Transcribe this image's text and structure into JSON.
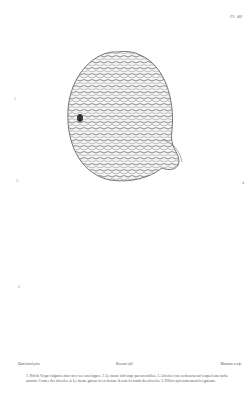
{
  "plate": {
    "number": "Pl. 40",
    "figure_labels": [
      "1",
      "2",
      "3",
      "4"
    ],
    "credits": {
      "left": "Blanchard pinx.",
      "center": "Bocourt del.",
      "right": "Manteau sculp."
    },
    "caption": "1. Nid de Vespa vulgaris entier avec ses enveloppes. 2. Le meme nid coupe par son milieu. 3. Alveoles vus en dessous sur lesquels une tache annonce l'entree des alveoles. 4. Le meme gateau vu en dessus: là sont les fonds des alveoles. 5. Pilliers qui soutiennent les gateaux."
  },
  "figures": [
    {
      "id": "nest-exterior",
      "desc": "Wasp nest exterior with paper envelopes"
    },
    {
      "id": "comb-underside",
      "desc": "Hexagonal comb cells viewed from below"
    },
    {
      "id": "comb-top",
      "desc": "Comb viewed from above with pillars"
    },
    {
      "id": "nest-section",
      "desc": "Nest cut through the middle showing stacked combs"
    }
  ],
  "colors": {
    "ink": "#444444",
    "paper": "#ffffff"
  }
}
